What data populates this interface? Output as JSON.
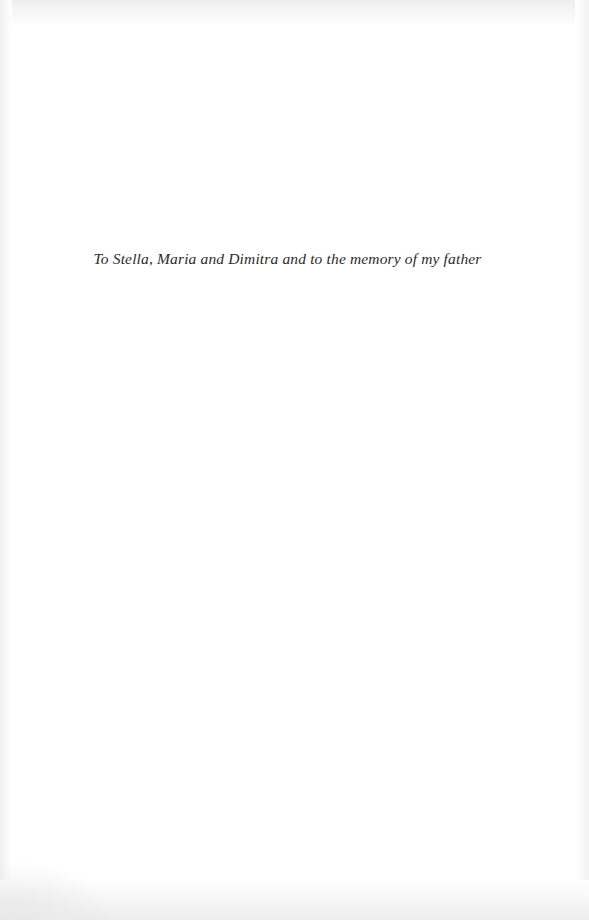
{
  "page": {
    "kind": "book-dedication-page",
    "background_color": "#ffffff",
    "width": 589,
    "height": 920
  },
  "dedication": {
    "text": "To Stella, Maria and Dimitra and to the memory of my father",
    "style": "italic",
    "color": "#2b2b2b",
    "alignment": "center"
  }
}
